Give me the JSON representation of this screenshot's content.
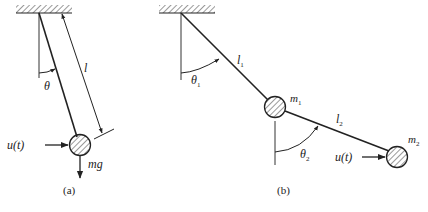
{
  "figure": {
    "panels": [
      {
        "id": "a",
        "caption": "(a)",
        "title": "Single pendulum",
        "labels": {
          "angle": "θ",
          "length": "l",
          "force": "u(t)",
          "weight": "mg"
        }
      },
      {
        "id": "b",
        "caption": "(b)",
        "title": "Double pendulum",
        "labels": {
          "angle1": "θ",
          "angle1_sub": "1",
          "length1": "l",
          "length1_sub": "1",
          "mass1": "m",
          "mass1_sub": "1",
          "angle2": "θ",
          "angle2_sub": "2",
          "length2": "l",
          "length2_sub": "2",
          "mass2": "m",
          "mass2_sub": "2",
          "force": "u(t)"
        }
      }
    ],
    "colors": {
      "stroke": "#222222",
      "hatch": "#555555",
      "background": "#ffffff"
    }
  }
}
